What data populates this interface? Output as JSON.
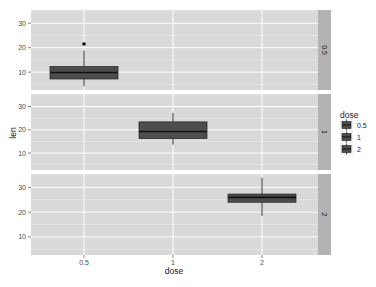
{
  "chart_data": {
    "type": "boxplot",
    "title": "",
    "xlabel": "dose",
    "ylabel": "len",
    "categories": [
      "0.5",
      "1",
      "2"
    ],
    "facet_by": "dose",
    "facet_labels": [
      "0.5",
      "1",
      "2"
    ],
    "y_ticks": [
      10,
      20,
      30
    ],
    "ylim": [
      2.7,
      35.4
    ],
    "grid": true,
    "legend": {
      "title": "dose",
      "position": "right",
      "entries": [
        "0.5",
        "1",
        "2"
      ]
    },
    "series": [
      {
        "name": "0.5",
        "x": "0.5",
        "facet": "0.5",
        "whisker_low": 4.2,
        "q1": 7.2,
        "median": 9.85,
        "q3": 12.25,
        "whisker_high": 18.8,
        "outliers": [
          21.5
        ]
      },
      {
        "name": "1",
        "x": "1",
        "facet": "1",
        "whisker_low": 13.6,
        "q1": 16.25,
        "median": 19.25,
        "q3": 23.4,
        "whisker_high": 27.3,
        "outliers": []
      },
      {
        "name": "2",
        "x": "2",
        "facet": "2",
        "whisker_low": 18.5,
        "q1": 24.0,
        "median": 25.95,
        "q3": 27.3,
        "whisker_high": 33.9,
        "outliers": []
      }
    ]
  },
  "colors": {
    "panel_bg": "#d9d9d9",
    "strip_bg": "#b3b3b3",
    "grid_major": "#ffffff",
    "grid_minor": "#ececec",
    "box_fill": "#4d4d4d",
    "box_line": "#1f1f1f",
    "whisker": "#333333"
  }
}
